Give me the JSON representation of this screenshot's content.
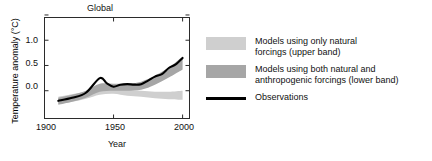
{
  "chart_data": {
    "type": "line",
    "title": "Global",
    "xlabel": "Year",
    "ylabel": "Temperature anomaly (°C)",
    "xlim": [
      1900,
      2005
    ],
    "ylim": [
      -0.55,
      1.45
    ],
    "xticks": [
      1900,
      1950,
      2000
    ],
    "xtick_labels": [
      "1900",
      "1950",
      "2000"
    ],
    "yticks": [
      0.0,
      0.5,
      1.0,
      1.5
    ],
    "ytick_labels": [
      "0.0",
      "0.5",
      "1.0",
      ""
    ],
    "grid": false,
    "legend_position": "right",
    "series": [
      {
        "name": "Observations",
        "type": "line",
        "color": "#000000",
        "x": [
          1910,
          1920,
          1930,
          1940,
          1945,
          1950,
          1955,
          1960,
          1965,
          1970,
          1975,
          1980,
          1985,
          1990,
          1995,
          2000
        ],
        "values": [
          -0.2,
          -0.14,
          -0.04,
          0.25,
          0.15,
          0.08,
          0.12,
          0.13,
          0.12,
          0.13,
          0.2,
          0.28,
          0.33,
          0.45,
          0.52,
          0.65
        ]
      },
      {
        "name": "Models using only natural forcings (upper band)",
        "type": "band",
        "color": "#cfcfcf",
        "x": [
          1910,
          1920,
          1930,
          1940,
          1950,
          1960,
          1970,
          1980,
          1990,
          2000
        ],
        "lower": [
          -0.26,
          -0.22,
          -0.16,
          -0.08,
          -0.06,
          -0.1,
          -0.12,
          -0.15,
          -0.17,
          -0.18
        ],
        "upper": [
          -0.12,
          -0.07,
          -0.01,
          0.1,
          0.08,
          0.02,
          0.0,
          -0.02,
          -0.02,
          0.0
        ]
      },
      {
        "name": "Models using both natural and anthropogenic forcings (lower band)",
        "type": "band",
        "color": "#a6a6a6",
        "x": [
          1910,
          1920,
          1930,
          1940,
          1950,
          1960,
          1970,
          1980,
          1990,
          2000
        ],
        "lower": [
          -0.28,
          -0.22,
          -0.14,
          -0.02,
          0.0,
          0.0,
          0.02,
          0.12,
          0.26,
          0.42
        ],
        "upper": [
          -0.14,
          -0.08,
          0.0,
          0.14,
          0.14,
          0.14,
          0.18,
          0.3,
          0.46,
          0.68
        ]
      }
    ]
  },
  "legend": {
    "items": [
      {
        "swatch": "light-gray-band-swatch",
        "color": "#cfcfcf",
        "line1": "Models using only natural",
        "line2": "forcings (upper band)"
      },
      {
        "swatch": "dark-gray-band-swatch",
        "color": "#a6a6a6",
        "line1": "Models using both natural and",
        "line2": "anthropogenic forcings (lower band)"
      },
      {
        "swatch": "black-line-swatch",
        "color": "#000000",
        "line1": "Observations",
        "line2": ""
      }
    ]
  }
}
